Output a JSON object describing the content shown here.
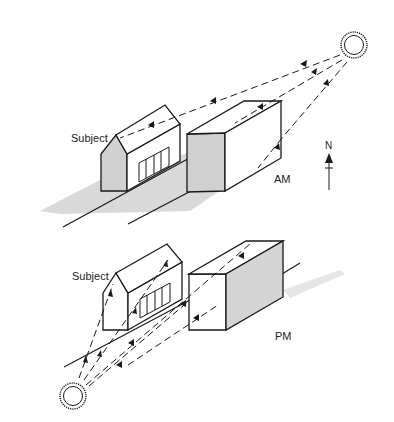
{
  "diagram": {
    "type": "sun-light-illustration",
    "panels": [
      {
        "id": "am",
        "time_label": "AM",
        "subject_label": "Subject",
        "compass_label": "N",
        "sun_position": "upper-right"
      },
      {
        "id": "pm",
        "time_label": "PM",
        "subject_label": "Subject",
        "sun_position": "lower-left"
      }
    ],
    "colors": {
      "line": "#1a1a1a",
      "shadow": "#c8c8c8",
      "face_shade": "#d4d4d4",
      "background": "#ffffff"
    }
  }
}
